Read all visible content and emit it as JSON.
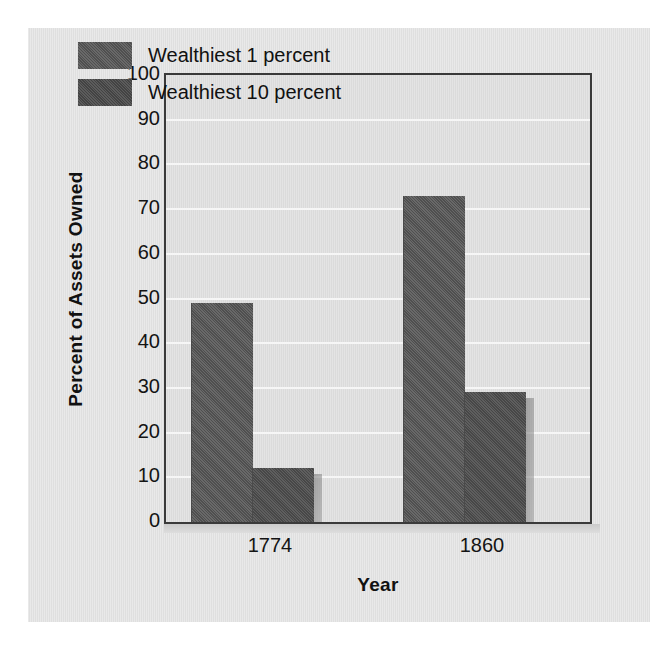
{
  "chart_data": {
    "type": "bar",
    "title": "",
    "xlabel": "Year",
    "ylabel": "Percent of Assets Owned",
    "categories": [
      "1774",
      "1860"
    ],
    "series": [
      {
        "name": "Wealthiest 1 percent",
        "values": [
          49,
          73
        ]
      },
      {
        "name": "Wealthiest 10 percent",
        "values": [
          12,
          29
        ]
      }
    ],
    "ylim": [
      0,
      100
    ],
    "yticks": [
      100,
      90,
      80,
      70,
      60,
      50,
      40,
      30,
      20,
      10,
      0
    ],
    "grid": true,
    "legend_position": "top-left",
    "bar_color": "#585858",
    "bar_color_alt": "#515151",
    "frame_color": "#3a3a3a",
    "gridline_color": "#f6f6f6",
    "plot_background": "#e4e4e4",
    "page_background": "#e9e9e9"
  },
  "legend": {
    "items": [
      {
        "label": "Wealthiest 1 percent"
      },
      {
        "label": "Wealthiest 10 percent"
      }
    ]
  },
  "axes": {
    "y_title": "Percent of Assets Owned",
    "x_title": "Year",
    "y_ticks": [
      "100",
      "90",
      "80",
      "70",
      "60",
      "50",
      "40",
      "30",
      "20",
      "10",
      "0"
    ],
    "x_ticks": [
      "1774",
      "1860"
    ]
  }
}
